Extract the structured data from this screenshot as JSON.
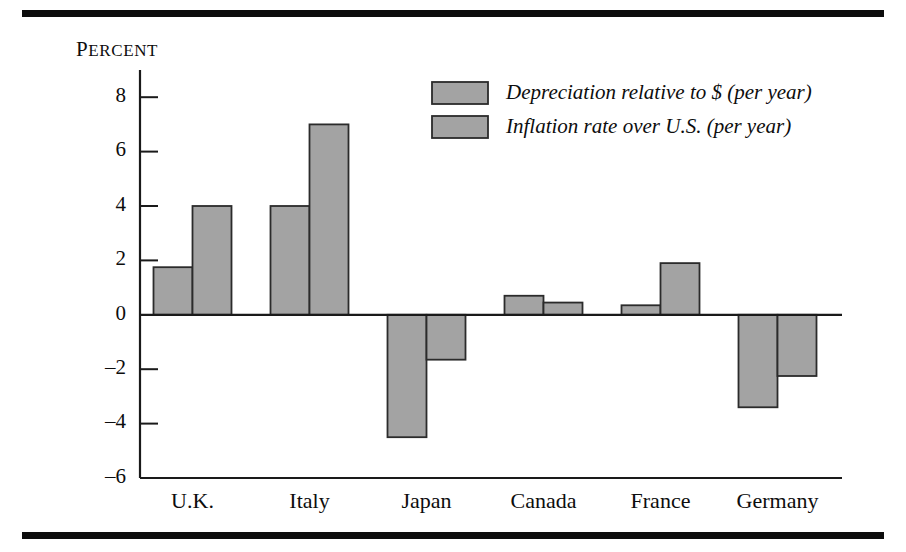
{
  "chart_data": {
    "type": "bar",
    "title": "",
    "xlabel": "",
    "ylabel": "Percent",
    "ylabel_display": "PERCENT",
    "ylim": [
      -6,
      9
    ],
    "ytick_values": [
      8,
      6,
      4,
      2,
      0,
      -2,
      -4,
      -6
    ],
    "ytick_labels": [
      "8",
      "6",
      "4",
      "2",
      "0",
      "–2",
      "–4",
      "–6"
    ],
    "grid": false,
    "legend_position": "top-center-right",
    "categories": [
      "U.K.",
      "Italy",
      "Japan",
      "Canada",
      "France",
      "Germany"
    ],
    "series": [
      {
        "name": "Depreciation relative to $ (per year)",
        "color": "#a3a3a3",
        "values": [
          1.75,
          4.0,
          -4.5,
          0.7,
          0.35,
          -3.4
        ]
      },
      {
        "name": "Inflation rate over U.S. (per year)",
        "color": "#a3a3a3",
        "values": [
          4.0,
          7.0,
          -1.65,
          0.45,
          1.9,
          -2.25
        ]
      }
    ],
    "bar_fill_color": "#a3a3a3",
    "bar_edge_color": "#2b2b2b",
    "rule_color": "#0d0d0d"
  }
}
